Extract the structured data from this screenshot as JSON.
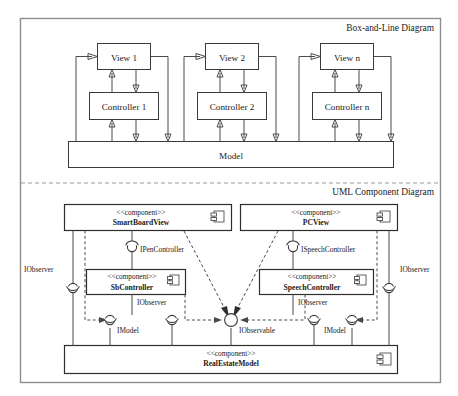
{
  "figure": {
    "background": "#ffffff",
    "line_color": "#4a4a4a",
    "frame_color": "#8e8e8e"
  },
  "sections": {
    "top": {
      "label": "Box-and-Line Diagram"
    },
    "bottom": {
      "label": "UML Component Diagram"
    }
  },
  "box_and_line": {
    "triads": [
      {
        "view": "View 1",
        "controller": "Controller 1"
      },
      {
        "view": "View 2",
        "controller": "Controller 2"
      },
      {
        "view": "View n",
        "controller": "Controller n"
      }
    ],
    "model": "Model"
  },
  "uml": {
    "stereotype": "<<component>>",
    "components": {
      "smartboard_view": "SmartBoardView",
      "pc_view": "PCView",
      "sb_controller": "SbController",
      "speech_controller": "SpeechController",
      "real_estate_model": "RealEstateModel"
    },
    "interfaces": {
      "observer_left": "IObserver",
      "observer_right": "IObserver",
      "pen_controller": "IPenController",
      "speech_controller_iface": "ISpeechController",
      "observer_sb": "IObserver",
      "observer_speech": "IObserver",
      "model_left": "IModel",
      "model_right": "IModel",
      "observable": "IObservable"
    },
    "icon_names": {
      "component": "component-icon",
      "provided": "provided-interface-ball-icon",
      "required": "required-interface-socket-icon"
    }
  }
}
